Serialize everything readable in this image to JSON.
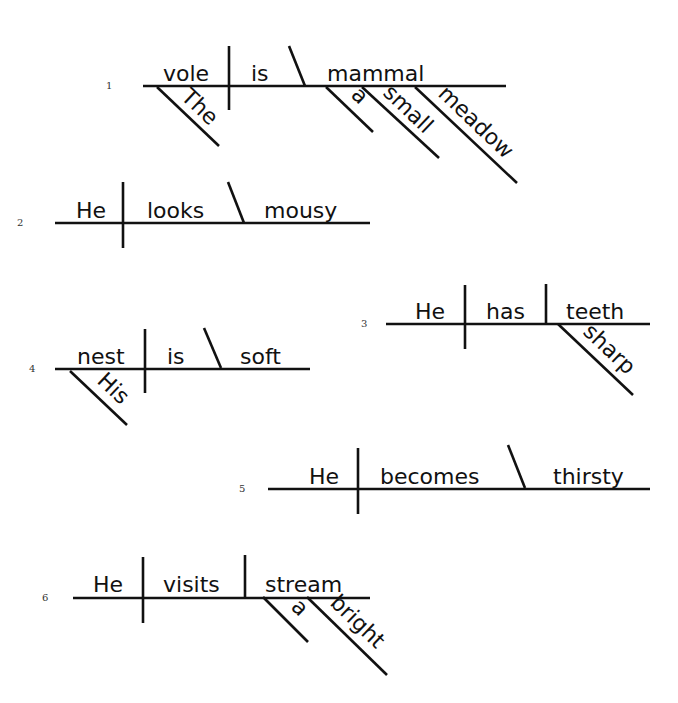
{
  "page": {
    "background": "#ffffff",
    "ink_color": "#111111",
    "top_clipped_text": "g                             g"
  },
  "diagrams": [
    {
      "number": "1",
      "sentence": "The vole is a small meadow mammal",
      "subject": "vole",
      "verb": "is",
      "complement": "mammal",
      "complement_type": "predicate nominative",
      "modifiers": [
        {
          "word": "The",
          "modifies": "vole"
        },
        {
          "word": "a",
          "modifies": "mammal"
        },
        {
          "word": "small",
          "modifies": "mammal"
        },
        {
          "word": "meadow",
          "modifies": "mammal"
        }
      ]
    },
    {
      "number": "2",
      "sentence": "He looks mousy",
      "subject": "He",
      "verb": "looks",
      "complement": "mousy",
      "complement_type": "predicate adjective",
      "modifiers": []
    },
    {
      "number": "3",
      "sentence": "He has sharp teeth",
      "subject": "He",
      "verb": "has",
      "complement": "teeth",
      "complement_type": "direct object",
      "modifiers": [
        {
          "word": "sharp",
          "modifies": "teeth"
        }
      ]
    },
    {
      "number": "4",
      "sentence": "His nest is soft",
      "subject": "nest",
      "verb": "is",
      "complement": "soft",
      "complement_type": "predicate adjective",
      "modifiers": [
        {
          "word": "His",
          "modifies": "nest"
        }
      ]
    },
    {
      "number": "5",
      "sentence": "He becomes thirsty",
      "subject": "He",
      "verb": "becomes",
      "complement": "thirsty",
      "complement_type": "predicate adjective",
      "modifiers": []
    },
    {
      "number": "6",
      "sentence": "He visits a bright stream",
      "subject": "He",
      "verb": "visits",
      "complement": "stream",
      "complement_type": "direct object",
      "modifiers": [
        {
          "word": "a",
          "modifies": "stream"
        },
        {
          "word": "bright",
          "modifies": "stream"
        }
      ]
    }
  ]
}
